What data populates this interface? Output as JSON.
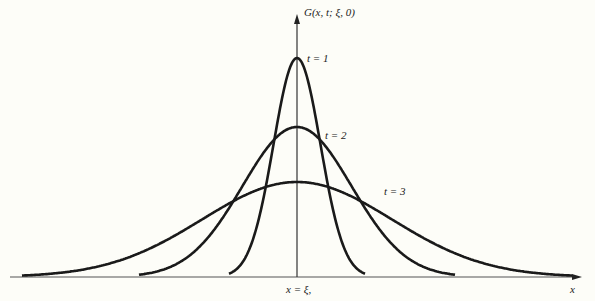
{
  "figure": {
    "y_axis_label": "G(x, t; ξ, 0)",
    "x_axis_label": "x",
    "center_label": "x = ξ,",
    "curves": [
      {
        "label": "t = 1",
        "peak_y": 58,
        "half_width": 68
      },
      {
        "label": "t = 2",
        "peak_y": 127,
        "half_width": 158
      },
      {
        "label": "t = 3",
        "peak_y": 182,
        "half_width": 275
      }
    ],
    "colors": {
      "background": "#fdfdf8",
      "ink": "#1a1a1a"
    }
  }
}
